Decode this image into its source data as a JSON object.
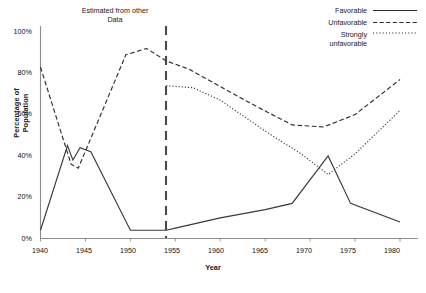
{
  "chart_data": {
    "type": "line",
    "title": "",
    "xlabel": "Year",
    "ylabel": "Percentage of Population",
    "xlim": [
      1940,
      1981
    ],
    "ylim": [
      0,
      100
    ],
    "grid": false,
    "legend_position": "top-right",
    "x_ticks": [
      "1940",
      "1945",
      "1950",
      "1955",
      "1960",
      "1965",
      "1970",
      "1975",
      "1980"
    ],
    "y_ticks": [
      "0%",
      "20%",
      "40%",
      "60%",
      "80%",
      "100%"
    ],
    "annotations": [
      {
        "name": "estimated-region-note",
        "text_line1": "Estimated from other",
        "text_line2": "Data",
        "x": 1946.5,
        "y": 104
      },
      {
        "name": "divider",
        "text": "",
        "x": 1954,
        "style": "dashed-vertical"
      }
    ],
    "series": [
      {
        "name": "Favorable",
        "style": "solid",
        "color": "#3a3a3a",
        "points": [
          [
            1940,
            4
          ],
          [
            1943,
            45
          ],
          [
            1943.6,
            38
          ],
          [
            1944.4,
            44
          ],
          [
            1945.6,
            42
          ],
          [
            1950,
            4
          ],
          [
            1954,
            4
          ],
          [
            1955,
            5
          ],
          [
            1960,
            10
          ],
          [
            1965,
            14
          ],
          [
            1968,
            17
          ],
          [
            1972,
            40
          ],
          [
            1974.5,
            17
          ],
          [
            1980,
            8
          ]
        ]
      },
      {
        "name": "Unfavorable",
        "style": "dashed",
        "color": "#2e2e2e",
        "points": [
          [
            1940,
            83
          ],
          [
            1943.4,
            36
          ],
          [
            1944.2,
            34
          ],
          [
            1949.5,
            89
          ],
          [
            1951.8,
            92
          ],
          [
            1954,
            86
          ],
          [
            1956.5,
            82
          ],
          [
            1959,
            76
          ],
          [
            1964,
            64
          ],
          [
            1968,
            55
          ],
          [
            1971.5,
            54
          ],
          [
            1975,
            60
          ],
          [
            1980,
            77
          ]
        ]
      },
      {
        "name": "Strongly unfavorable",
        "style": "dotted",
        "color": "#2e2e2e",
        "points": [
          [
            1954,
            74
          ],
          [
            1957,
            73
          ],
          [
            1960,
            67
          ],
          [
            1965,
            52
          ],
          [
            1969,
            41
          ],
          [
            1972,
            31
          ],
          [
            1975,
            41
          ],
          [
            1980,
            62
          ]
        ]
      }
    ]
  },
  "axis": {
    "ylabel": "Percentage of Population",
    "xlabel": "Year",
    "y_ticks": [
      {
        "label": "100%",
        "value": 100
      },
      {
        "label": "80%",
        "value": 80
      },
      {
        "label": "60%",
        "value": 60
      },
      {
        "label": "40%",
        "value": 40
      },
      {
        "label": "20%",
        "value": 20
      },
      {
        "label": "0%",
        "value": 0
      }
    ],
    "x_ticks": [
      {
        "label": "1940",
        "value": 1940
      },
      {
        "label": "1945",
        "value": 1945
      },
      {
        "label": "1950",
        "value": 1950
      },
      {
        "label": "1955",
        "value": 1955
      },
      {
        "label": "1960",
        "value": 1960
      },
      {
        "label": "1965",
        "value": 1965
      },
      {
        "label": "1970",
        "value": 1970
      },
      {
        "label": "1975",
        "value": 1975
      },
      {
        "label": "1980",
        "value": 1980
      }
    ]
  },
  "annotation": {
    "line1": "Estimated from other",
    "line2": "Data"
  },
  "legend": {
    "items": [
      {
        "label": "Favorable",
        "label2": "",
        "style": "solid"
      },
      {
        "label": "Unfavorable",
        "label2": "",
        "style": "dashed"
      },
      {
        "label": "Strongly",
        "label2": "unfavorable",
        "style": "dotted"
      }
    ]
  },
  "caption": {
    "text": ""
  }
}
